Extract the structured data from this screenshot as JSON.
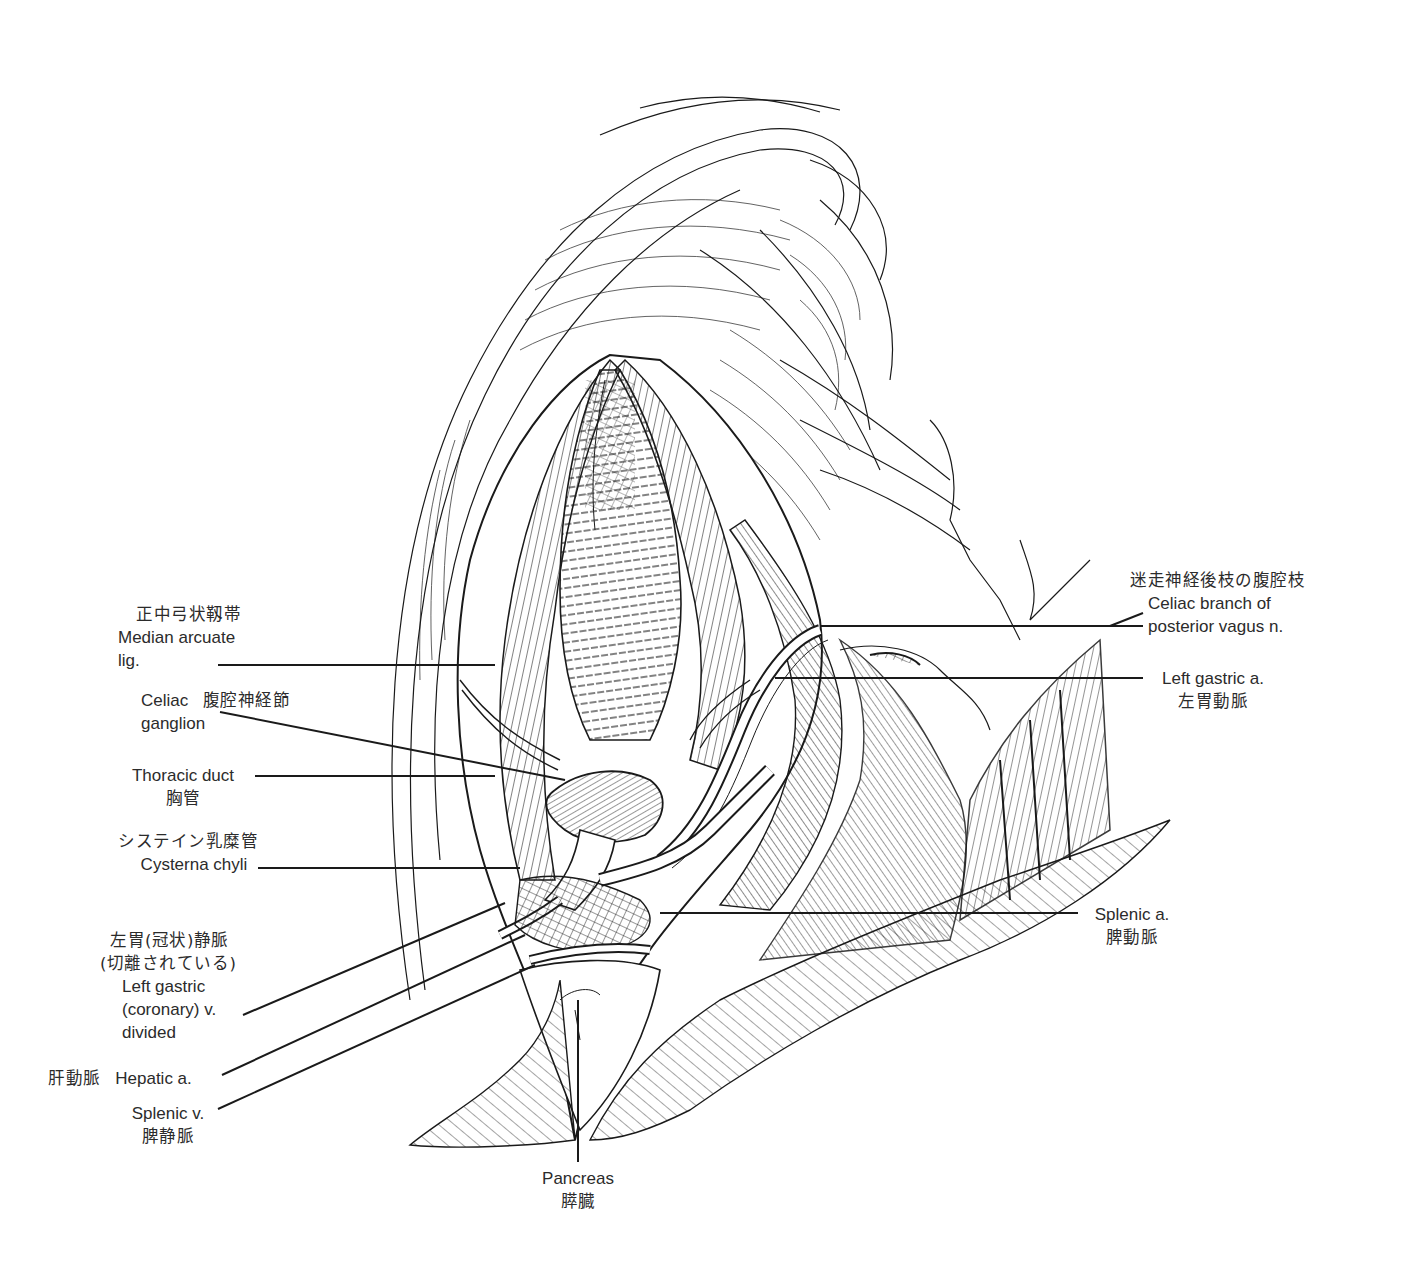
{
  "figure": {
    "line_color": "#1a1a1a",
    "background": "#ffffff"
  },
  "labels": {
    "median_arcuate": {
      "jp": "正中弓状靱帯",
      "en1": "Median arcuate",
      "en2": "lig."
    },
    "celiac_ganglion": {
      "en1": "Celiac",
      "jp": "腹腔神経節",
      "en2": "ganglion"
    },
    "thoracic_duct": {
      "en": "Thoracic duct",
      "jp": "胸管"
    },
    "cysterna_chyli": {
      "jp": "システイン乳糜管",
      "en": "Cysterna chyli"
    },
    "left_gastric_v": {
      "jp1": "左胃(冠状)静脈",
      "jp2": "(切離されている)",
      "en1": "Left gastric",
      "en2": "(coronary) v.",
      "en3": "divided"
    },
    "hepatic_a": {
      "jp": "肝動脈",
      "en": "Hepatic a."
    },
    "splenic_v": {
      "en": "Splenic v.",
      "jp": "脾静脈"
    },
    "pancreas": {
      "en": "Pancreas",
      "jp": "膵臓"
    },
    "celiac_branch": {
      "jp": "迷走神経後枝の腹腔枝",
      "en1": "Celiac branch of",
      "en2": "posterior vagus n."
    },
    "left_gastric_a": {
      "en": "Left gastric a.",
      "jp": "左胃動脈"
    },
    "splenic_a": {
      "en": "Splenic a.",
      "jp": "脾動脈"
    }
  }
}
